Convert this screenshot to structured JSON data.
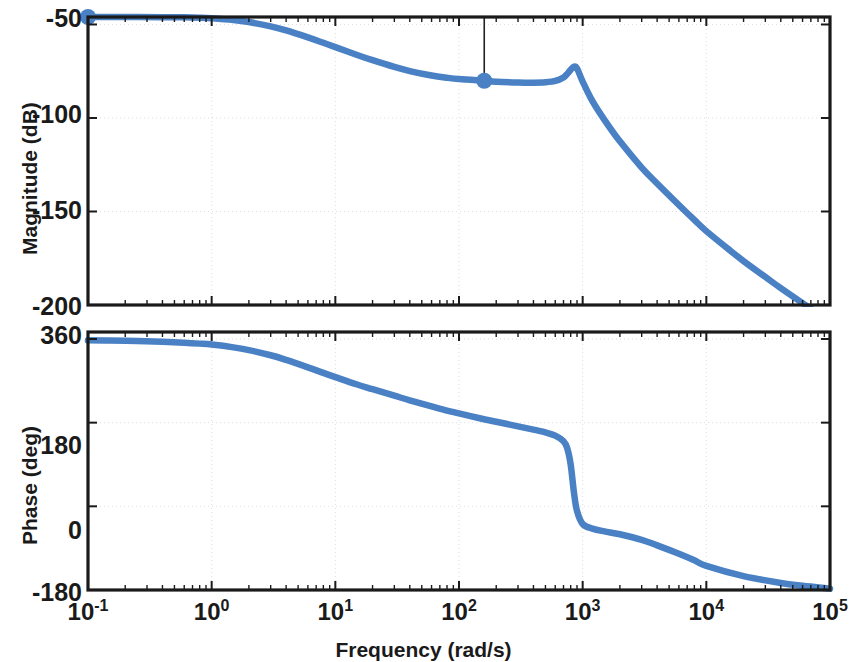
{
  "figure": {
    "type": "bode-plot",
    "background_color": "#ffffff",
    "line_color": "#4A81C4",
    "axis_color": "#1a1a1a",
    "grid_color": "#d9d9d9"
  },
  "xaxis": {
    "label": "Frequency  (rad/s)",
    "scale": "log",
    "min": 0.1,
    "max": 100000,
    "tick_values": [
      0.1,
      1,
      10,
      100,
      1000,
      10000,
      100000
    ],
    "tick_labels": [
      "10-1",
      "100",
      "101",
      "102",
      "103",
      "104",
      "105"
    ],
    "tick_mantissa": [
      "10",
      "10",
      "10",
      "10",
      "10",
      "10",
      "10"
    ],
    "tick_exponents": [
      "-1",
      "0",
      "1",
      "2",
      "3",
      "4",
      "5"
    ]
  },
  "magnitude_axis": {
    "label": "Magnitude (dB)",
    "unit": "dB",
    "min": -200,
    "max": -46,
    "tick_values": [
      -50,
      -100,
      -150,
      -200
    ],
    "tick_labels": [
      "-50",
      "-100",
      "-150",
      "-200"
    ]
  },
  "phase_axis": {
    "label": "Phase (deg)",
    "unit": "deg",
    "min": -180,
    "max": 375,
    "tick_values": [
      360,
      180,
      0,
      -180
    ],
    "tick_labels": [
      "360",
      "180",
      "0",
      "-180"
    ]
  },
  "chart_data": [
    {
      "type": "line",
      "title": "",
      "name": "magnitude-plot",
      "xlabel": "Frequency  (rad/s)",
      "ylabel": "Magnitude (dB)",
      "xscale": "log",
      "xlim": [
        0.1,
        100000
      ],
      "ylim": [
        -200,
        -46
      ],
      "grid": true,
      "legend": null,
      "series": [
        {
          "name": "Magnitude",
          "color": "#4A81C4",
          "x": [
            0.1,
            0.15,
            0.25,
            0.4,
            0.6,
            0.8,
            1.0,
            1.5,
            2.0,
            3.0,
            4.0,
            6.0,
            8.0,
            10,
            15,
            20,
            30,
            40,
            60,
            80,
            100,
            150,
            160,
            200,
            300,
            400,
            500,
            600,
            700,
            760,
            800,
            850,
            900,
            1000,
            1200,
            1500,
            2000,
            3000,
            4000,
            6000,
            8000,
            10000,
            15000,
            20000,
            30000,
            40000,
            60000,
            80000,
            100000
          ],
          "y": [
            -46.0,
            -46.0,
            -46.0,
            -46.1,
            -46.2,
            -46.4,
            -46.7,
            -47.6,
            -48.7,
            -51.0,
            -53.2,
            -56.9,
            -59.8,
            -62.1,
            -66.3,
            -69.1,
            -72.7,
            -74.9,
            -77.3,
            -78.5,
            -79.2,
            -80.0,
            -80.1,
            -80.6,
            -81.0,
            -81.1,
            -80.9,
            -80.2,
            -78.3,
            -76.0,
            -74.2,
            -72.6,
            -73.5,
            -80.5,
            -91.0,
            -101.0,
            -112.5,
            -126.5,
            -135.0,
            -146.5,
            -154.5,
            -160.5,
            -170.0,
            -176.5,
            -185.0,
            -191.0,
            -199.0,
            -204.5,
            -209.0
          ]
        }
      ],
      "markers": [
        {
          "name": "left-edge-marker",
          "x": 0.1,
          "y": -46.0,
          "color": "#4A81C4"
        },
        {
          "name": "data-cursor-marker",
          "x": 160,
          "y": -80.1,
          "color": "#4A81C4",
          "has_stem": true
        }
      ]
    },
    {
      "type": "line",
      "title": "",
      "name": "phase-plot",
      "xlabel": "Frequency  (rad/s)",
      "ylabel": "Phase (deg)",
      "xscale": "log",
      "xlim": [
        0.1,
        100000
      ],
      "ylim": [
        -180,
        375
      ],
      "grid": true,
      "legend": null,
      "series": [
        {
          "name": "Phase",
          "color": "#4A81C4",
          "x": [
            0.1,
            0.15,
            0.25,
            0.4,
            0.6,
            0.8,
            1.0,
            1.5,
            2.0,
            3.0,
            4.0,
            6.0,
            8.0,
            10,
            15,
            20,
            30,
            40,
            60,
            80,
            100,
            150,
            200,
            300,
            400,
            500,
            600,
            700,
            750,
            800,
            850,
            900,
            1000,
            1200,
            1500,
            2000,
            3000,
            4000,
            6000,
            8000,
            10000,
            20000,
            40000,
            60000,
            100000
          ],
          "y": [
            357.0,
            356.5,
            355.5,
            354.0,
            352.0,
            350.0,
            348.0,
            342.0,
            336.0,
            325.0,
            315.0,
            299.0,
            287.0,
            278.0,
            262.0,
            252.0,
            238.0,
            228.0,
            215.0,
            206.0,
            200.0,
            189.0,
            182.0,
            172.0,
            165.0,
            159.0,
            152.0,
            140.0,
            125.0,
            90.0,
            30.0,
            -10.0,
            -38.0,
            -48.0,
            -54.0,
            -60.0,
            -72.0,
            -84.0,
            -102.0,
            -116.0,
            -128.0,
            -150.0,
            -165.0,
            -171.0,
            -177.0
          ]
        }
      ]
    }
  ]
}
